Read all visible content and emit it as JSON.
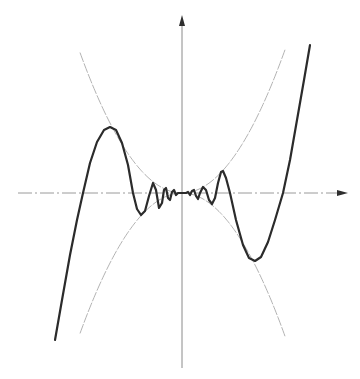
{
  "chart_data": {
    "type": "line",
    "title": "",
    "xlabel": "",
    "ylabel": "",
    "grid": false,
    "legend": null,
    "axes": {
      "origin_px": [
        182,
        193
      ],
      "x_axis": {
        "from_px": 18,
        "to_px": 348,
        "arrow": true,
        "style": "dash-dot"
      },
      "y_axis": {
        "from_px": 368,
        "to_px": 15,
        "arrow": true,
        "style": "solid"
      }
    },
    "series": [
      {
        "name": "oscillating-function",
        "role": "main-curve",
        "color": "#2b2b2b",
        "points_px": [
          [
            55,
            340
          ],
          [
            62,
            300
          ],
          [
            70,
            255
          ],
          [
            77,
            220
          ],
          [
            83,
            193
          ],
          [
            90,
            163
          ],
          [
            97,
            142
          ],
          [
            104,
            130
          ],
          [
            110,
            127
          ],
          [
            116,
            130
          ],
          [
            122,
            143
          ],
          [
            128,
            165
          ],
          [
            133,
            193
          ],
          [
            137,
            209
          ],
          [
            141,
            215
          ],
          [
            145,
            211
          ],
          [
            149,
            196
          ],
          [
            153,
            183
          ],
          [
            156,
            190
          ],
          [
            159,
            208
          ],
          [
            162,
            203
          ],
          [
            164,
            190
          ],
          [
            166,
            188
          ],
          [
            168,
            198
          ],
          [
            170,
            200
          ],
          [
            172,
            192
          ],
          [
            174,
            190
          ],
          [
            176,
            195
          ],
          [
            178,
            193
          ],
          [
            182,
            193
          ],
          [
            186,
            193
          ],
          [
            188,
            192
          ],
          [
            190,
            195
          ],
          [
            192,
            191
          ],
          [
            194,
            190
          ],
          [
            196,
            196
          ],
          [
            198,
            199
          ],
          [
            200,
            193
          ],
          [
            203,
            187
          ],
          [
            206,
            190
          ],
          [
            209,
            200
          ],
          [
            212,
            204
          ],
          [
            215,
            198
          ],
          [
            218,
            183
          ],
          [
            221,
            172
          ],
          [
            223,
            171
          ],
          [
            226,
            178
          ],
          [
            230,
            193
          ],
          [
            236,
            220
          ],
          [
            243,
            245
          ],
          [
            249,
            258
          ],
          [
            255,
            261
          ],
          [
            261,
            257
          ],
          [
            268,
            242
          ],
          [
            275,
            220
          ],
          [
            283,
            193
          ],
          [
            290,
            160
          ],
          [
            297,
            120
          ],
          [
            304,
            80
          ],
          [
            310,
            45
          ]
        ]
      },
      {
        "name": "upper-envelope",
        "role": "envelope",
        "color": "#a9a9a9",
        "description": "y = +a*x^2",
        "a_px": 0.0135,
        "x_range_px": [
          80,
          285
        ]
      },
      {
        "name": "lower-envelope",
        "role": "envelope",
        "color": "#a9a9a9",
        "description": "y = -a*x^2",
        "a_px": 0.0135,
        "x_range_px": [
          80,
          285
        ]
      }
    ]
  }
}
